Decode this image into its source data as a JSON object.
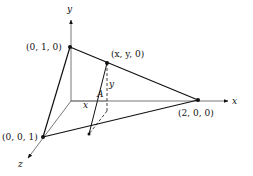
{
  "diagram": {
    "type": "3d-coordinate-sketch",
    "axes": {
      "x_label": "x",
      "y_label": "y",
      "z_label": "z"
    },
    "points": {
      "p010": "(0, 1, 0)",
      "pxy0": "(x, y, 0)",
      "p200": "(2, 0, 0)",
      "p001": "(0, 0, 1)"
    },
    "annotations": {
      "area": "A",
      "height": "y",
      "base": "x"
    },
    "colors": {
      "line": "#111111",
      "thin_line": "#555555",
      "background": "#ffffff"
    }
  }
}
